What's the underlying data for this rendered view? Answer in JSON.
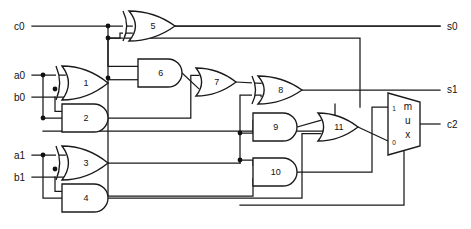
{
  "diagram": {
    "type": "logic-circuit",
    "background_color": "#ffffff",
    "line_color": "#1a1a1a"
  },
  "inputs": [
    {
      "name": "c0",
      "label": "c0",
      "x": 14,
      "y": 26
    },
    {
      "name": "a0",
      "label": "a0",
      "x": 14,
      "y": 75
    },
    {
      "name": "b0",
      "label": "b0",
      "x": 14,
      "y": 97
    },
    {
      "name": "a1",
      "label": "a1",
      "x": 14,
      "y": 155
    },
    {
      "name": "b1",
      "label": "b1",
      "x": 14,
      "y": 177
    }
  ],
  "outputs": [
    {
      "name": "s0",
      "label": "s0",
      "x": 447,
      "y": 26
    },
    {
      "name": "s1",
      "label": "s1",
      "x": 447,
      "y": 89
    },
    {
      "name": "c2",
      "label": "c2",
      "x": 447,
      "y": 124
    }
  ],
  "gates": [
    {
      "id": "1",
      "label": "1",
      "kind": "xor",
      "x": 62,
      "y": 66,
      "w": 46,
      "h": 34
    },
    {
      "id": "2",
      "label": "2",
      "kind": "and",
      "x": 62,
      "y": 104,
      "w": 46,
      "h": 28
    },
    {
      "id": "3",
      "label": "3",
      "kind": "xor",
      "x": 62,
      "y": 146,
      "w": 46,
      "h": 34
    },
    {
      "id": "4",
      "label": "4",
      "kind": "and",
      "x": 62,
      "y": 184,
      "w": 46,
      "h": 28
    },
    {
      "id": "5",
      "label": "5",
      "kind": "xor",
      "x": 129,
      "y": 11,
      "w": 46,
      "h": 30
    },
    {
      "id": "6",
      "label": "6",
      "kind": "and",
      "x": 138,
      "y": 59,
      "w": 44,
      "h": 28
    },
    {
      "id": "7",
      "label": "7",
      "kind": "or",
      "x": 196,
      "y": 68,
      "w": 40,
      "h": 28
    },
    {
      "id": "8",
      "label": "8",
      "kind": "xor",
      "x": 258,
      "y": 76,
      "w": 44,
      "h": 28
    },
    {
      "id": "9",
      "label": "9",
      "kind": "and",
      "x": 253,
      "y": 113,
      "w": 44,
      "h": 28
    },
    {
      "id": "10",
      "label": "10",
      "kind": "and",
      "x": 253,
      "y": 158,
      "w": 44,
      "h": 28
    },
    {
      "id": "11",
      "label": "11",
      "kind": "or",
      "x": 318,
      "y": 113,
      "w": 40,
      "h": 28
    }
  ],
  "mux": {
    "name": "output-mux",
    "label_chars": [
      "m",
      "u",
      "x"
    ],
    "select_labels": {
      "top": "1",
      "bottom": "0"
    },
    "x": 388,
    "y": 93,
    "w": 32,
    "h": 62
  },
  "junction_dots": [
    {
      "x": 108,
      "y": 26
    },
    {
      "x": 108,
      "y": 38
    },
    {
      "x": 108,
      "y": 78
    },
    {
      "x": 43,
      "y": 75
    },
    {
      "x": 55,
      "y": 89
    },
    {
      "x": 43,
      "y": 118
    },
    {
      "x": 43,
      "y": 155
    },
    {
      "x": 55,
      "y": 169
    },
    {
      "x": 240,
      "y": 133
    },
    {
      "x": 240,
      "y": 160
    }
  ]
}
